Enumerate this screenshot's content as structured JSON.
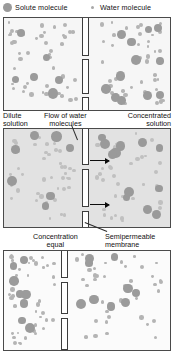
{
  "legend": {
    "solute": {
      "label": "Solute molecule",
      "icon": "solute-circle-icon",
      "color": "#9a9a9a"
    },
    "water": {
      "label": "Water molecule",
      "icon": "water-dot-icon",
      "color": "#a8a8a8"
    }
  },
  "captions": {
    "dilute_solution": "Dilute\nsolution",
    "dilute_line1": "Dilute",
    "dilute_line2": "solution",
    "flow_line1": "Flow of water",
    "flow_line2": "molecules",
    "concentrated_line1": "Concentrated",
    "concentrated_line2": "solution",
    "equal_line1": "Concentration",
    "equal_line2": "equal",
    "membrane_line1": "Semipermeable",
    "membrane_line2": "membrane"
  },
  "panels": [
    {
      "id": "top",
      "name": "initial-state-panel",
      "background": "#f6f6f6",
      "left_concentration": "dilute",
      "right_concentration": "concentrated"
    },
    {
      "id": "mid",
      "name": "osmosis-flow-panel",
      "background": "#e2e2e2",
      "left_concentration": "dilute",
      "right_concentration": "concentrated"
    },
    {
      "id": "bot",
      "name": "equilibrium-panel",
      "background": "#fbfbfb",
      "left_concentration": "equal",
      "right_concentration": "equal"
    }
  ],
  "membrane": {
    "name": "semipermeable-membrane",
    "segments_per_panel": 3,
    "fill": "#ffffff",
    "stroke": "#3c3c3c"
  },
  "arrows": {
    "name": "water-flow-arrow",
    "count": 2,
    "direction": "right",
    "color": "#0d0d0d"
  },
  "chart_data": {
    "type": "diagram",
    "panels": [
      {
        "stage": 1,
        "label": "initial",
        "left_side": {
          "name": "Dilute solution",
          "solute_count": 6,
          "water_count": 46
        },
        "right_side": {
          "name": "Concentrated solution",
          "solute_count": 12,
          "water_count": 40
        }
      },
      {
        "stage": 2,
        "label": "Flow of water molecules",
        "left_side": {
          "name": "Dilute solution",
          "solute_count": 7,
          "water_count": 40
        },
        "right_side": {
          "name": "Concentrated solution",
          "solute_count": 12,
          "water_count": 36
        }
      },
      {
        "stage": 3,
        "label": "Concentration equal",
        "left_side": {
          "name": "Concentration equal",
          "solute_count": 9,
          "water_count": 40
        },
        "right_side": {
          "name": "Concentration equal",
          "solute_count": 9,
          "water_count": 40
        }
      }
    ]
  }
}
